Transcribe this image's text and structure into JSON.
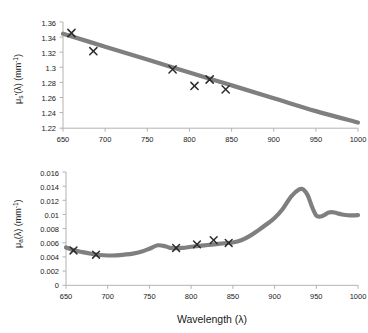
{
  "figure": {
    "name": "optical-properties-two-panel-figure",
    "line_color": "#7f7f7f",
    "marker_color": "#2b2b2b",
    "axis_color": "#b3b3b3",
    "background": "#ffffff",
    "shared_xlabel": "Wavelength (λ)"
  },
  "chart_data": [
    {
      "id": "reduced-scattering-coefficient",
      "type": "line",
      "title": "",
      "xlabel": "",
      "ylabel": "μs'(λ) (mm⁻¹)",
      "ylabel_parts": {
        "mu": "μ",
        "sub": "s",
        "prime": "'",
        "lambda": "(λ)",
        "units": "(mm",
        "units_sup": "-1",
        "units_close": ")"
      },
      "xlim": [
        650,
        1000
      ],
      "ylim": [
        1.22,
        1.36
      ],
      "xticks": [
        650,
        700,
        750,
        800,
        850,
        900,
        950,
        1000
      ],
      "yticks": [
        1.22,
        1.24,
        1.26,
        1.28,
        1.3,
        1.32,
        1.34,
        1.36
      ],
      "ytick_labels": [
        "1.22",
        "1.24",
        "1.26",
        "1.28",
        "1.3",
        "1.32",
        "1.34",
        "1.36"
      ],
      "grid": false,
      "legend": "none",
      "series": [
        {
          "name": "fit-line",
          "style": "thick-gray-line",
          "x": [
            650,
            700,
            750,
            800,
            850,
            900,
            950,
            1000
          ],
          "values": [
            1.3445,
            1.3275,
            1.3105,
            1.2935,
            1.2765,
            1.2595,
            1.2425,
            1.2275
          ]
        },
        {
          "name": "measured-points",
          "style": "x-markers",
          "x": [
            660,
            686,
            780,
            806,
            824,
            843
          ],
          "values": [
            1.3455,
            1.3215,
            1.2975,
            1.2757,
            1.2842,
            1.2712
          ]
        }
      ]
    },
    {
      "id": "absorption-coefficient",
      "type": "line",
      "title": "",
      "xlabel": "Wavelength (λ)",
      "ylabel": "μa(λ) (mm⁻¹)",
      "ylabel_parts": {
        "mu": "μ",
        "sub": "a",
        "lambda": "(λ)",
        "units": "(mm",
        "units_sup": "-1",
        "units_close": ")"
      },
      "xlim": [
        650,
        1000
      ],
      "ylim": [
        0,
        0.016
      ],
      "xticks": [
        650,
        700,
        750,
        800,
        850,
        900,
        950,
        1000
      ],
      "yticks": [
        0,
        0.002,
        0.004,
        0.006,
        0.008,
        0.01,
        0.012,
        0.014,
        0.016
      ],
      "ytick_labels": [
        "0",
        "0.002",
        "0.004",
        "0.006",
        "0.008",
        "0.01",
        "0.012",
        "0.014",
        "0.016"
      ],
      "grid": false,
      "legend": "none",
      "series": [
        {
          "name": "spectrum-curve",
          "style": "thick-gray-line",
          "x": [
            650,
            660,
            670,
            680,
            690,
            700,
            710,
            720,
            730,
            740,
            750,
            760,
            770,
            775,
            780,
            790,
            800,
            810,
            820,
            830,
            840,
            850,
            860,
            870,
            880,
            890,
            900,
            910,
            920,
            930,
            935,
            940,
            945,
            950,
            955,
            960,
            965,
            970,
            975,
            980,
            985,
            990,
            995,
            1000
          ],
          "values": [
            0.00535,
            0.00495,
            0.00468,
            0.00446,
            0.00428,
            0.00421,
            0.00424,
            0.00434,
            0.00448,
            0.00474,
            0.00517,
            0.00565,
            0.00548,
            0.00528,
            0.00523,
            0.00529,
            0.00544,
            0.00557,
            0.00569,
            0.00582,
            0.00594,
            0.00605,
            0.00636,
            0.00694,
            0.00772,
            0.00858,
            0.00951,
            0.01082,
            0.01255,
            0.01357,
            0.01348,
            0.01265,
            0.01105,
            0.00985,
            0.00972,
            0.00995,
            0.01028,
            0.01032,
            0.01018,
            0.01003,
            0.00993,
            0.00988,
            0.00988,
            0.00992
          ]
        },
        {
          "name": "measured-points",
          "style": "x-markers",
          "x": [
            659,
            686,
            782,
            807,
            827,
            845
          ],
          "values": [
            0.00492,
            0.00432,
            0.00527,
            0.00578,
            0.00637,
            0.00598
          ]
        }
      ]
    }
  ]
}
